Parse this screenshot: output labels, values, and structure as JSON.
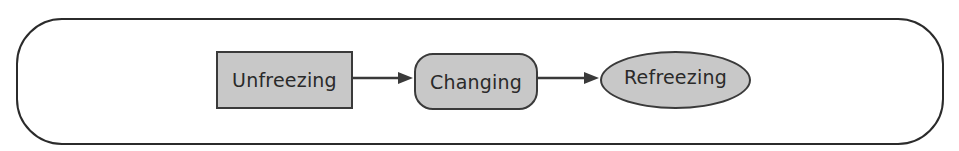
{
  "diagram": {
    "title": "",
    "fill_color": "#c8c8c8",
    "stroke_color": "#3a3a3a",
    "nodes": [
      {
        "id": "unfreezing",
        "label": "Unfreezing",
        "shape": "rectangle"
      },
      {
        "id": "changing",
        "label": "Changing",
        "shape": "rounded-rectangle"
      },
      {
        "id": "refreezing",
        "label": "Refreezing",
        "shape": "ellipse"
      }
    ],
    "edges": [
      {
        "from": "unfreezing",
        "to": "changing"
      },
      {
        "from": "changing",
        "to": "refreezing"
      }
    ]
  }
}
